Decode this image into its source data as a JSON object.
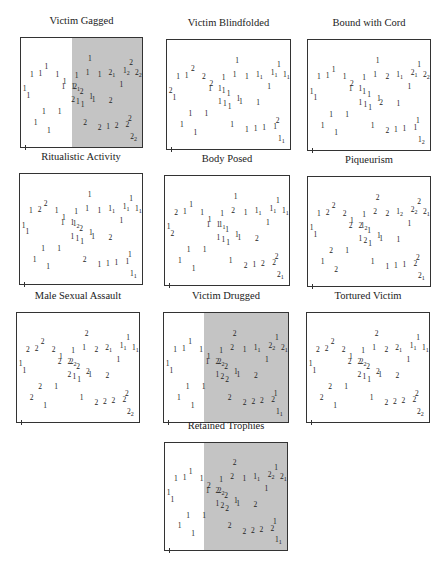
{
  "figure": {
    "panels": [
      {
        "title": "Victim Gagged",
        "shaded_from": 0.42
      },
      {
        "title": "Victim Blindfolded",
        "shaded_from": null
      },
      {
        "title": "Bound with Cord",
        "shaded_from": null
      },
      {
        "title": "Ritualistic Activity",
        "shaded_from": null
      },
      {
        "title": "Body Posed",
        "shaded_from": null
      },
      {
        "title": "Piqueurism",
        "shaded_from": null
      },
      {
        "title": "Male Sexual Assault",
        "shaded_from": null
      },
      {
        "title": "Victim Drugged",
        "shaded_from": 0.32
      },
      {
        "title": "Tortured Victim",
        "shaded_from": null
      },
      {
        "title": "Retained Trophies",
        "shaded_from": 0.32
      }
    ]
  },
  "colors": {
    "shade": "#c4c4c4",
    "border": "#333333",
    "text": "#222222"
  },
  "chart_data": {
    "type": "scatter",
    "xlabel": "",
    "ylabel": "",
    "grid": false,
    "legend": "none (point labels 1/2)",
    "points_xy": [
      [
        0.57,
        0.18
      ],
      [
        0.91,
        0.22
      ],
      [
        0.21,
        0.26
      ],
      [
        0.09,
        0.33
      ],
      [
        0.16,
        0.32
      ],
      [
        0.3,
        0.33
      ],
      [
        0.46,
        0.34
      ],
      [
        0.55,
        0.31
      ],
      [
        0.65,
        0.33
      ],
      [
        0.75,
        0.33
      ],
      [
        0.87,
        0.31
      ],
      [
        0.97,
        0.33
      ],
      [
        0.03,
        0.46
      ],
      [
        0.06,
        0.52
      ],
      [
        0.43,
        0.44
      ],
      [
        0.46,
        0.46
      ],
      [
        0.5,
        0.49
      ],
      [
        0.43,
        0.56
      ],
      [
        0.47,
        0.58
      ],
      [
        0.51,
        0.61
      ],
      [
        0.58,
        0.53
      ],
      [
        0.6,
        0.56
      ],
      [
        0.74,
        0.57
      ],
      [
        0.83,
        0.42
      ],
      [
        0.19,
        0.67
      ],
      [
        0.32,
        0.67
      ],
      [
        0.12,
        0.77
      ],
      [
        0.23,
        0.84
      ],
      [
        0.53,
        0.77
      ],
      [
        0.65,
        0.82
      ],
      [
        0.72,
        0.81
      ],
      [
        0.79,
        0.8
      ],
      [
        0.9,
        0.73
      ],
      [
        0.88,
        0.79
      ],
      [
        0.93,
        0.92
      ],
      [
        0.35,
        0.44
      ],
      [
        0.36,
        0.39
      ]
    ],
    "series": [
      {
        "name": "Victim Gagged",
        "labels": [
          "1",
          "2",
          "1",
          "1",
          "1",
          "1",
          "1",
          "1",
          "1",
          "21",
          "12",
          "22",
          "1",
          "1",
          "1",
          "21",
          "2",
          "2",
          "1",
          "1",
          "1",
          "1",
          "2",
          "1",
          "1",
          "1",
          "1",
          "1",
          "2",
          "2",
          "1",
          "2",
          "2",
          "2",
          "22",
          "1",
          "1"
        ]
      },
      {
        "name": "Victim Blindfolded",
        "labels": [
          "1",
          "1",
          "2",
          "1",
          "1",
          "2",
          "1",
          "1",
          "1",
          "11",
          "11",
          "11",
          "2",
          "1",
          "1",
          "1",
          "1",
          "1",
          "1",
          "1",
          "1",
          "1",
          "1",
          "1",
          "1",
          "1",
          "1",
          "1",
          "1",
          "1",
          "1",
          "1",
          "2",
          "1",
          "11",
          "1",
          "2"
        ]
      },
      {
        "name": "Bound with Cord",
        "labels": [
          "1",
          "1",
          "1",
          "1",
          "1",
          "1",
          "1",
          "1",
          "2",
          "11",
          "21",
          "22",
          "1",
          "1",
          "1",
          "1",
          "1",
          "1",
          "1",
          "1",
          "1",
          "2",
          "1",
          "1",
          "1",
          "1",
          "1",
          "1",
          "1",
          "2",
          "1",
          "1",
          "1",
          "1",
          "12",
          "1",
          "2"
        ]
      },
      {
        "name": "Ritualistic Activity",
        "labels": [
          "1",
          "1",
          "2",
          "1",
          "2",
          "1",
          "1",
          "1",
          "1",
          "11",
          "11",
          "11",
          "1",
          "1",
          "1",
          "12",
          "2",
          "1",
          "1",
          "1",
          "1",
          "1",
          "2",
          "1",
          "1",
          "1",
          "1",
          "1",
          "2",
          "1",
          "1",
          "1",
          "1",
          "1",
          "11",
          "1",
          "1"
        ]
      },
      {
        "name": "Body Posed",
        "labels": [
          "1",
          "1",
          "1",
          "2",
          "1",
          "1",
          "1",
          "2",
          "1",
          "11",
          "11",
          "11",
          "1",
          "2",
          "1",
          "11",
          "1",
          "1",
          "1",
          "1",
          "1",
          "1",
          "2",
          "1",
          "1",
          "1",
          "1",
          "1",
          "1",
          "2",
          "1",
          "2",
          "2",
          "2",
          "21",
          "1",
          "1"
        ]
      },
      {
        "name": "Piqueurism",
        "labels": [
          "2",
          "2",
          "2",
          "1",
          "2",
          "2",
          "1",
          "2",
          "2",
          "12",
          "22",
          "21",
          "1",
          "1",
          "2",
          "12",
          "1",
          "1",
          "2",
          "1",
          "1",
          "1",
          "1",
          "1",
          "2",
          "1",
          "1",
          "2",
          "1",
          "1",
          "1",
          "1",
          "2",
          "2",
          "21",
          "2",
          "1"
        ]
      },
      {
        "name": "Male Sexual Assault",
        "labels": [
          "2",
          "1",
          "2",
          "2",
          "2",
          "2",
          "1",
          "1",
          "2",
          "21",
          "11",
          "11",
          "1",
          "1",
          "2",
          "22",
          "2",
          "2",
          "1",
          "1",
          "2",
          "1",
          "2",
          "1",
          "2",
          "1",
          "2",
          "1",
          "1",
          "2",
          "2",
          "2",
          "2",
          "2",
          "22",
          "2",
          "1"
        ]
      },
      {
        "name": "Victim Drugged",
        "labels": [
          "2",
          "1",
          "1",
          "1",
          "1",
          "1",
          "1",
          "2",
          "1",
          "11",
          "22",
          "21",
          "1",
          "1",
          "2",
          "22",
          "2",
          "1",
          "2",
          "2",
          "1",
          "1",
          "2",
          "1",
          "1",
          "1",
          "1",
          "1",
          "2",
          "2",
          "2",
          "2",
          "1",
          "2",
          "11",
          "1",
          "1"
        ]
      },
      {
        "name": "Tortured Victim",
        "labels": [
          "2",
          "1",
          "2",
          "2",
          "2",
          "2",
          "1",
          "1",
          "2",
          "21",
          "11",
          "11",
          "1",
          "1",
          "2",
          "22",
          "2",
          "2",
          "1",
          "1",
          "2",
          "1",
          "2",
          "1",
          "2",
          "1",
          "2",
          "1",
          "1",
          "2",
          "2",
          "2",
          "2",
          "2",
          "22",
          "2",
          "1"
        ]
      },
      {
        "name": "Retained Trophies",
        "labels": [
          "2",
          "1",
          "1",
          "1",
          "1",
          "1",
          "1",
          "2",
          "1",
          "11",
          "22",
          "21",
          "1",
          "1",
          "2",
          "22",
          "2",
          "1",
          "2",
          "2",
          "1",
          "1",
          "2",
          "1",
          "1",
          "1",
          "1",
          "1",
          "2",
          "2",
          "2",
          "2",
          "1",
          "2",
          "11",
          "1",
          "2"
        ]
      }
    ]
  }
}
